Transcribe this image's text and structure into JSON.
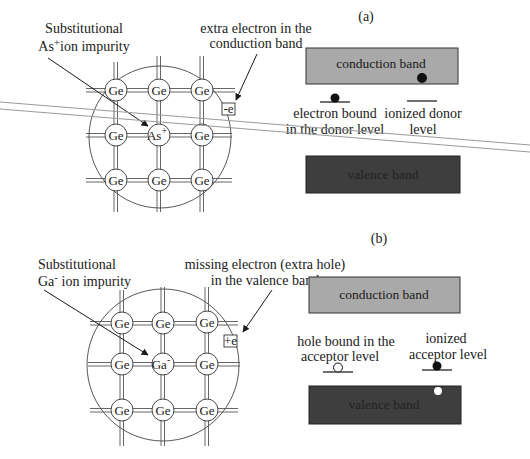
{
  "panels": [
    {
      "id": "a",
      "label": "(a)",
      "impurity_caption_line1": "Substitutional",
      "impurity_caption_line2_prefix": "As",
      "impurity_caption_line2_sup": "+",
      "impurity_caption_line2_suffix": "ion impurity",
      "carrier_caption_line1": "extra electron in the",
      "carrier_caption_line2": "conduction band",
      "carrier_box": "-e",
      "atoms": [
        "Ge",
        "Ge",
        "Ge",
        "Ge",
        "As",
        "Ge",
        "Ge",
        "Ge",
        "Ge"
      ],
      "center_atom_sup": "+",
      "conduction_band": "conduction band",
      "valence_band": "valence band",
      "level_left_line1": "electron bound",
      "level_left_line2": "in the donor level",
      "level_right_line1": "ionized donor",
      "level_right_line2": "level"
    },
    {
      "id": "b",
      "label": "(b)",
      "impurity_caption_line1": "Substitutional",
      "impurity_caption_line2_prefix": "Ga",
      "impurity_caption_line2_sup": "-",
      "impurity_caption_line2_suffix": " ion impurity",
      "carrier_caption_line1": "missing electron (extra hole)",
      "carrier_caption_line2": "in the valence band",
      "carrier_box": "+e",
      "atoms": [
        "Ge",
        "Ge",
        "Ge",
        "Ge",
        "Ga",
        "Ge",
        "Ge",
        "Ge",
        "Ge"
      ],
      "center_atom_sup": "-",
      "conduction_band": "conduction band",
      "valence_band": "valence band",
      "level_left_line1": "hole bound in the",
      "level_left_line2": "acceptor level",
      "level_right_line1": "ionized",
      "level_right_line2": "acceptor  level"
    }
  ],
  "colors": {
    "conduction_band_fill": "#a9a9a9",
    "valence_band_fill": "#3e3e3e",
    "valence_text": "#222222",
    "ink": "#1a1a1a",
    "stray_line": "#9a9a9a"
  }
}
